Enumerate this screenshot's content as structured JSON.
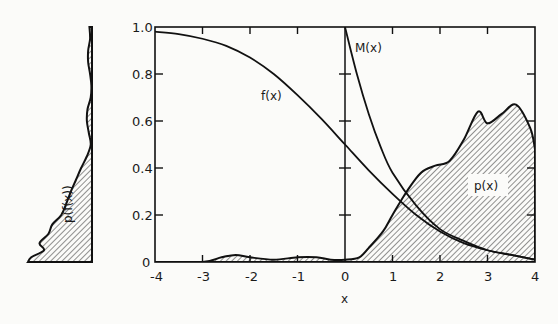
{
  "chart_data": [
    {
      "type": "line",
      "title": "",
      "xlabel": "x",
      "ylabel": "",
      "xlim": [
        -4,
        4
      ],
      "ylim": [
        0,
        1.0
      ],
      "grid": false,
      "legend": "none (curves labeled inline)",
      "x_ticks": [
        "-4",
        "-3",
        "-2",
        "-1",
        "0",
        "1",
        "2",
        "3",
        "4"
      ],
      "y_ticks": [
        "0",
        "0.2",
        "0.4",
        "0.6",
        "0.8",
        "1.0"
      ],
      "series": [
        {
          "name": "f(x)",
          "style": "solid line",
          "x": [
            -4,
            -3.5,
            -3,
            -2.5,
            -2,
            -1.5,
            -1,
            -0.5,
            0,
            0.5,
            1,
            1.5,
            2,
            2.5,
            3,
            3.5,
            4
          ],
          "y": [
            0.98,
            0.97,
            0.95,
            0.92,
            0.87,
            0.8,
            0.71,
            0.61,
            0.5,
            0.39,
            0.29,
            0.2,
            0.13,
            0.08,
            0.05,
            0.03,
            0.01
          ]
        },
        {
          "name": "M(x)",
          "style": "solid line, defined for x >= 0",
          "x": [
            0,
            0.25,
            0.5,
            0.75,
            1,
            1.5,
            2,
            2.5,
            3,
            3.5,
            4
          ],
          "y": [
            1.0,
            0.8,
            0.63,
            0.49,
            0.38,
            0.24,
            0.14,
            0.09,
            0.05,
            0.03,
            0.01
          ]
        },
        {
          "name": "p(x)",
          "style": "hatched area",
          "x": [
            -4,
            -3,
            -2.6,
            -2.3,
            -2,
            -1.5,
            -1,
            -0.6,
            -0.3,
            0,
            0.3,
            0.5,
            0.8,
            1,
            1.3,
            1.6,
            1.9,
            2.2,
            2.5,
            2.8,
            3.0,
            3.3,
            3.6,
            3.9,
            4.0
          ],
          "y": [
            0.0,
            0.0,
            0.02,
            0.03,
            0.02,
            0.01,
            0.02,
            0.02,
            0.01,
            0.01,
            0.02,
            0.06,
            0.13,
            0.2,
            0.3,
            0.38,
            0.41,
            0.43,
            0.52,
            0.64,
            0.59,
            0.63,
            0.67,
            0.57,
            0.48
          ]
        }
      ],
      "annotations": [
        {
          "text": "f(x)",
          "x": -0.9,
          "y": 0.78
        },
        {
          "text": "M(x)",
          "x": 0.3,
          "y": 0.88
        },
        {
          "text": "p(x)",
          "x": 3.1,
          "y": 0.33
        }
      ]
    },
    {
      "type": "area",
      "title": "",
      "orientation": "vertical (marginal density plotted along the f(x) axis, extending leftwards)",
      "label": "p(f(x))",
      "shares_y_axis_with": "main plot (0 to 1.0)",
      "y": [
        0.0,
        0.02,
        0.05,
        0.08,
        0.12,
        0.16,
        0.2,
        0.25,
        0.3,
        0.35,
        0.4,
        0.45,
        0.5,
        0.55,
        0.6,
        0.65,
        0.7,
        0.75,
        0.8,
        0.85,
        0.9,
        0.95,
        1.0
      ],
      "density_relative": [
        1.0,
        0.95,
        0.75,
        0.82,
        0.68,
        0.62,
        0.48,
        0.4,
        0.33,
        0.25,
        0.17,
        0.08,
        0.02,
        0.05,
        0.08,
        0.07,
        0.02,
        0.01,
        0.03,
        0.06,
        0.06,
        0.03,
        0.04
      ]
    }
  ],
  "labels": {
    "f_curve": "f(x)",
    "m_curve": "M(x)",
    "p_area": "p(x)",
    "marginal": "p(f(x))",
    "x_axis": "x"
  },
  "axis": {
    "x_ticks": [
      "-4",
      "-3",
      "-2",
      "-1",
      "0",
      "1",
      "2",
      "3",
      "4"
    ],
    "y_ticks": [
      "0",
      "0.2",
      "0.4",
      "0.6",
      "0.8",
      "1.0"
    ]
  }
}
